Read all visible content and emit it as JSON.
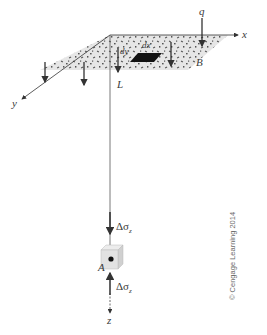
{
  "figure": {
    "axes": {
      "x": "x",
      "y": "y",
      "z": "z"
    },
    "area_labels": {
      "length": "L",
      "width": "B"
    },
    "load": {
      "label": "q"
    },
    "element": {
      "dx": "dx",
      "dy": "dy"
    },
    "point": {
      "label": "A"
    },
    "stress": {
      "top": "Δσz",
      "bottom": "Δσz",
      "symbol": "Δσ",
      "subscript": "z"
    },
    "credit": "© Cengage Learning 2014",
    "colors": {
      "area_fill": "#e6e6e6",
      "speckle": "#555555",
      "lines": "#333333",
      "text": "#3a3a3a"
    }
  }
}
